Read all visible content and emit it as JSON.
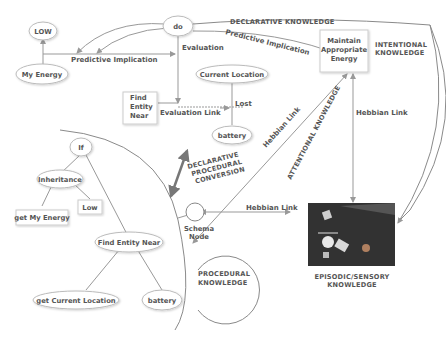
{
  "nodes": {
    "low": "LOW",
    "my_energy": "My Energy",
    "do": "do",
    "find_entity_near_box": [
      "Find",
      "Entity",
      "Near"
    ],
    "current_location": "Current Location",
    "battery_top": "battery",
    "maintain_energy": [
      "Maintain",
      "Appropriate",
      "Energy"
    ],
    "if": "If",
    "inheritance": "Inheritance",
    "low_small": "Low",
    "get_my_energy": "get My Energy",
    "find_entity_near_oval": "Find Entity Near",
    "get_current_location": "get Current Location",
    "battery_bottom": "battery",
    "schema_node": [
      "Schema",
      "Node"
    ]
  },
  "links": {
    "predictive_implication_1": "Predictive Implication",
    "predictive_implication_2": "Predictive Implication",
    "evaluation": "Evaluation",
    "evaluation_link": "Evaluation Link",
    "lost": "Lost",
    "hebbian_link_diag": "Hebbian Link",
    "hebbian_link_vert": "Hebbian Link",
    "hebbian_link_horiz": "Hebbian Link"
  },
  "regions": {
    "declarative": "DECLARATIVE KNOWLEDGE",
    "intentional": [
      "INTENTIONAL",
      "KNOWLEDGE"
    ],
    "attentional": "ATTENTIONAL KNOWLEDGE",
    "conversion": [
      "DECLARATIVE",
      "PROCEDURAL",
      "CONVERSION"
    ],
    "procedural": [
      "PROCEDURAL",
      "KNOWLEDGE"
    ],
    "episodic": [
      "EPISODIC/SENSORY",
      "KNOWLEDGE"
    ]
  },
  "colors": {
    "line": "#999999",
    "text": "#555555",
    "image_bg": "#2b2b2b"
  }
}
